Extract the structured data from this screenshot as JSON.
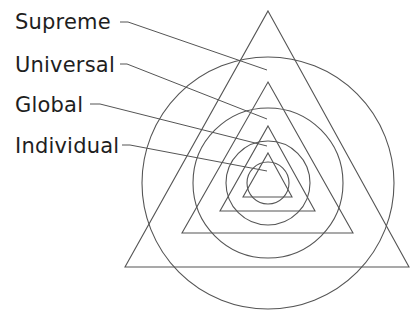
{
  "diagram": {
    "type": "nested concentric triangles and circles",
    "colors": {
      "line": "#555555",
      "text": "#1e1e1e",
      "background": "#ffffff"
    },
    "labels": [
      {
        "text": "Supreme",
        "level": 1,
        "x": 15,
        "y": 29
      },
      {
        "text": "Universal",
        "level": 2,
        "x": 15,
        "y": 72
      },
      {
        "text": "Global",
        "level": 3,
        "x": 15,
        "y": 112
      },
      {
        "text": "Individual",
        "level": 4,
        "x": 15,
        "y": 153
      }
    ],
    "center": {
      "x": 268,
      "y": 183
    },
    "triangles": [
      {
        "name": "supreme",
        "apex": [
          268,
          11
        ],
        "base_left": [
          125,
          267
        ],
        "base_right": [
          409,
          267
        ]
      },
      {
        "name": "universal",
        "apex": [
          268,
          82
        ],
        "base_left": [
          182,
          233
        ],
        "base_right": [
          353,
          233
        ]
      },
      {
        "name": "global",
        "apex": [
          268,
          126
        ],
        "base_left": [
          220,
          211
        ],
        "base_right": [
          315,
          211
        ]
      },
      {
        "name": "individual",
        "apex": [
          268,
          153
        ],
        "base_left": [
          243,
          197
        ],
        "base_right": [
          292,
          197
        ]
      }
    ],
    "circles": [
      {
        "name": "supreme",
        "cx": 268,
        "cy": 183,
        "r": 126
      },
      {
        "name": "universal",
        "cx": 268,
        "cy": 183,
        "r": 75
      },
      {
        "name": "global",
        "cx": 268,
        "cy": 183,
        "r": 42
      },
      {
        "name": "individual",
        "cx": 268,
        "cy": 183,
        "r": 21
      }
    ],
    "leaders": [
      {
        "from": [
          120,
          22
        ],
        "elbow": [
          128,
          22
        ],
        "to": [
          267,
          70
        ]
      },
      {
        "from": [
          120,
          64
        ],
        "elbow": [
          127,
          64
        ],
        "to": [
          267,
          119
        ]
      },
      {
        "from": [
          90,
          104
        ],
        "elbow": [
          100,
          104
        ],
        "to": [
          267,
          146
        ]
      },
      {
        "from": [
          122,
          145
        ],
        "elbow": [
          130,
          145
        ],
        "to": [
          267,
          171
        ]
      }
    ]
  }
}
